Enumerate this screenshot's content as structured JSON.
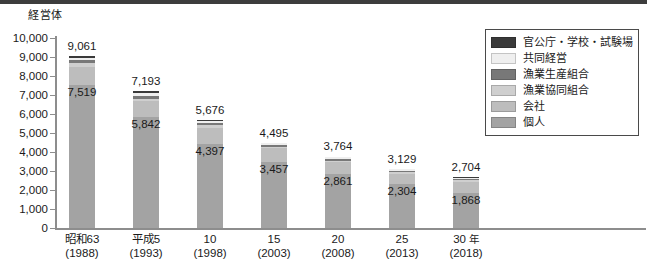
{
  "chart_data": {
    "type": "bar",
    "stacked": true,
    "title": "",
    "subtitle": "",
    "xlabel": "",
    "ylabel": "経営体",
    "y_unit": "経営体",
    "ylim": [
      0,
      10000
    ],
    "ytick_step": 1000,
    "yticks": [
      "10,000",
      "9,000",
      "8,000",
      "7,000",
      "6,000",
      "5,000",
      "4,000",
      "3,000",
      "2,000",
      "1,000",
      "0"
    ],
    "grid": false,
    "legend_position": "right-top",
    "categories": [
      "昭和63\n(1988)",
      "平成5\n(1993)",
      "10\n(1998)",
      "15\n(2003)",
      "20\n(2008)",
      "25\n(2013)",
      "30 年\n(2018)"
    ],
    "x_labels": [
      {
        "line1": "昭和63",
        "line2": "(1988)",
        "unit": ""
      },
      {
        "line1": "平成5",
        "line2": "(1993)",
        "unit": ""
      },
      {
        "line1": "10",
        "line2": "(1998)",
        "unit": ""
      },
      {
        "line1": "15",
        "line2": "(2003)",
        "unit": ""
      },
      {
        "line1": "20",
        "line2": "(2008)",
        "unit": ""
      },
      {
        "line1": "25",
        "line2": "(2013)",
        "unit": ""
      },
      {
        "line1": "30",
        "line2": "(2018)",
        "unit": "年"
      }
    ],
    "totals": [
      9061,
      7193,
      5676,
      4495,
      3764,
      3129,
      2704
    ],
    "total_labels": [
      "9,061",
      "7,193",
      "5,676",
      "4,495",
      "3,764",
      "3,129",
      "2,704"
    ],
    "individual_labels": [
      "7,519",
      "5,842",
      "4,397",
      "3,457",
      "2,861",
      "2,304",
      "1,868"
    ],
    "series": [
      {
        "name": "個人",
        "color": "#a3a3a3",
        "values": [
          7519,
          5842,
          4397,
          3457,
          2861,
          2304,
          1868
        ]
      },
      {
        "name": "会社",
        "color": "#bdbdbd",
        "values": [
          950,
          835,
          880,
          730,
          595,
          560,
          560
        ]
      },
      {
        "name": "漁業協同組合",
        "color": "#cfcfcf",
        "values": [
          190,
          130,
          120,
          100,
          90,
          80,
          80
        ]
      },
      {
        "name": "漁業生産組合",
        "color": "#787878",
        "values": [
          160,
          130,
          110,
          80,
          70,
          65,
          65
        ]
      },
      {
        "name": "共同経営",
        "color": "#efefef",
        "values": [
          152,
          156,
          119,
          98,
          98,
          80,
          81
        ]
      },
      {
        "name": "官公庁・学校・試験場",
        "color": "#3a3a3a",
        "values": [
          90,
          100,
          50,
          30,
          50,
          40,
          50
        ]
      }
    ]
  },
  "legend": {
    "items": [
      {
        "label": "官公庁・学校・試験場",
        "color": "#3a3a3a"
      },
      {
        "label": "共同経営",
        "color": "#efefef"
      },
      {
        "label": "漁業生産組合",
        "color": "#787878"
      },
      {
        "label": "漁業協同組合",
        "color": "#cfcfcf"
      },
      {
        "label": "会社",
        "color": "#bdbdbd"
      },
      {
        "label": "個人",
        "color": "#a3a3a3"
      }
    ]
  }
}
